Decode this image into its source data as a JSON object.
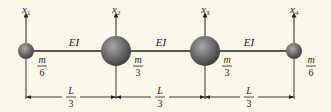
{
  "diagram": {
    "type": "lumped-mass beam model",
    "colors": {
      "background": "#fbf8e9",
      "line": "#222222",
      "mass_light": "#a9a9a9",
      "mass_dark": "#3a3a3a"
    },
    "coordinates": [
      {
        "label": "x",
        "subscript": "1"
      },
      {
        "label": "x",
        "subscript": "2"
      },
      {
        "label": "x",
        "subscript": "3"
      },
      {
        "label": "x",
        "subscript": "4"
      }
    ],
    "masses": [
      {
        "numerator": "m",
        "denominator": "6",
        "size": "small"
      },
      {
        "numerator": "m",
        "denominator": "3",
        "size": "large"
      },
      {
        "numerator": "m",
        "denominator": "3",
        "size": "large"
      },
      {
        "numerator": "m",
        "denominator": "6",
        "size": "small"
      }
    ],
    "segments": [
      {
        "stiffness": "EI",
        "length_num": "L",
        "length_den": "3"
      },
      {
        "stiffness": "EI",
        "length_num": "L",
        "length_den": "3"
      },
      {
        "stiffness": "EI",
        "length_num": "L",
        "length_den": "3"
      }
    ]
  }
}
